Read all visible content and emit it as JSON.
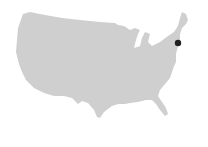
{
  "map": {
    "region": "United States (contiguous)",
    "land_color": "#cfcfcf",
    "background_color": "#ffffff",
    "markers": [
      {
        "label": "",
        "x": 178,
        "y": 43,
        "radius": 3.2,
        "color": "#1f1f1f"
      }
    ]
  }
}
